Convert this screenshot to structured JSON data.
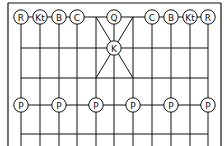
{
  "diagram": {
    "type": "chess-variant-board",
    "colors": {
      "line": "#111111",
      "background": "#ffffff",
      "piece_fill": "#ffffff"
    },
    "border": {
      "x1": 8,
      "y1": 3,
      "x2": 221,
      "y2": 146
    },
    "columns_x": [
      21,
      40,
      59,
      77,
      96,
      114,
      133,
      152,
      171,
      190,
      208
    ],
    "rows_y": [
      17,
      48,
      78,
      105,
      134
    ],
    "palace": {
      "x1": 96,
      "y1": 17,
      "x2": 133,
      "y2": 78
    },
    "pieces": [
      {
        "label": "R",
        "name": "rook",
        "col": 0,
        "row": 0
      },
      {
        "label": "Kt",
        "name": "knight",
        "col": 1,
        "row": 0
      },
      {
        "label": "B",
        "name": "bishop",
        "col": 2,
        "row": 0
      },
      {
        "label": "C",
        "name": "cannon",
        "col": 3,
        "row": 0
      },
      {
        "label": "Q",
        "name": "queen",
        "col": 5,
        "row": 0
      },
      {
        "label": "C",
        "name": "cannon",
        "col": 7,
        "row": 0
      },
      {
        "label": "B",
        "name": "bishop",
        "col": 8,
        "row": 0
      },
      {
        "label": "Kt",
        "name": "knight",
        "col": 9,
        "row": 0
      },
      {
        "label": "R",
        "name": "rook",
        "col": 10,
        "row": 0
      },
      {
        "label": "K",
        "name": "king",
        "col": 5,
        "row": 1
      },
      {
        "label": "P",
        "name": "pawn",
        "col": 0,
        "row": 3
      },
      {
        "label": "P",
        "name": "pawn",
        "col": 2,
        "row": 3
      },
      {
        "label": "P",
        "name": "pawn",
        "col": 4,
        "row": 3
      },
      {
        "label": "P",
        "name": "pawn",
        "col": 6,
        "row": 3
      },
      {
        "label": "P",
        "name": "pawn",
        "col": 8,
        "row": 3
      },
      {
        "label": "P",
        "name": "pawn",
        "col": 10,
        "row": 3
      }
    ]
  }
}
